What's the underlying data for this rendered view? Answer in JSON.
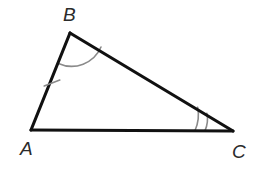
{
  "figure": {
    "kind": "triangle-diagram",
    "background_color": "#ffffff",
    "line_color": "#111111",
    "mark_color": "#8a8a8a",
    "label_color": "#2b2b2b",
    "vertices": [
      {
        "name": "A",
        "label": "A",
        "x": 31,
        "y": 130,
        "label_x": 20,
        "label_y": 155
      },
      {
        "name": "B",
        "label": "B",
        "x": 70,
        "y": 33,
        "label_x": 63,
        "label_y": 21
      },
      {
        "name": "C",
        "label": "C",
        "x": 233,
        "y": 131,
        "label_x": 232,
        "label_y": 158
      }
    ],
    "sides": [
      {
        "name": "side-AB",
        "from": "A",
        "to": "B",
        "tick_count": 1
      },
      {
        "name": "side-BC",
        "from": "B",
        "to": "C",
        "tick_count": 0
      },
      {
        "name": "side-AC",
        "from": "A",
        "to": "C",
        "tick_count": 0
      }
    ],
    "angle_marks": [
      {
        "name": "angle-B",
        "vertex": "B",
        "arc_count": 1,
        "radii": [
          32
        ]
      },
      {
        "name": "angle-C",
        "vertex": "C",
        "arc_count": 2,
        "radii": [
          28,
          38
        ]
      },
      {
        "name": "angle-A",
        "vertex": "A",
        "arc_count": 0,
        "radii": []
      }
    ],
    "tick_marks": [
      {
        "name": "tick-AB",
        "side": "side-AB",
        "x": 52,
        "y": 83,
        "length": 15
      }
    ]
  }
}
